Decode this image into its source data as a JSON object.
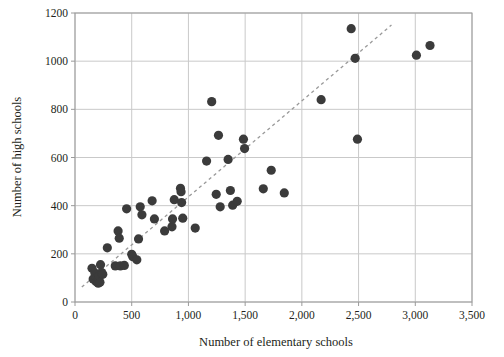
{
  "chart_data": {
    "type": "scatter",
    "title": "",
    "xlabel": "Number of elementary schools",
    "ylabel": "Number of high schools",
    "xlim": [
      0,
      3500
    ],
    "ylim": [
      0,
      1200
    ],
    "xticks": [
      0,
      500,
      1000,
      1500,
      2000,
      2500,
      3000,
      3500
    ],
    "xtick_labels": [
      "0",
      "500",
      "1,000",
      "1,500",
      "2,000",
      "2,500",
      "3,000",
      "3,500"
    ],
    "yticks": [
      0,
      200,
      400,
      600,
      800,
      1000,
      1200
    ],
    "ytick_labels": [
      "0",
      "200",
      "400",
      "600",
      "800",
      "1000",
      "1200"
    ],
    "grid": true,
    "legend": "none",
    "marker_color": "#3b3b3b",
    "marker_size": 4.6,
    "gridline_color": "#c9c9c9",
    "axis_color": "#9a9a9a",
    "points": [
      [
        150,
        140
      ],
      [
        160,
        95
      ],
      [
        175,
        120
      ],
      [
        185,
        85
      ],
      [
        195,
        100
      ],
      [
        200,
        88
      ],
      [
        205,
        78
      ],
      [
        210,
        92
      ],
      [
        215,
        108
      ],
      [
        220,
        82
      ],
      [
        225,
        155
      ],
      [
        235,
        122
      ],
      [
        245,
        115
      ],
      [
        285,
        225
      ],
      [
        355,
        150
      ],
      [
        380,
        295
      ],
      [
        390,
        265
      ],
      [
        400,
        150
      ],
      [
        435,
        152
      ],
      [
        455,
        387
      ],
      [
        500,
        198
      ],
      [
        510,
        188
      ],
      [
        545,
        175
      ],
      [
        560,
        262
      ],
      [
        575,
        395
      ],
      [
        590,
        362
      ],
      [
        680,
        420
      ],
      [
        700,
        345
      ],
      [
        790,
        295
      ],
      [
        855,
        312
      ],
      [
        860,
        345
      ],
      [
        875,
        425
      ],
      [
        930,
        472
      ],
      [
        935,
        458
      ],
      [
        940,
        413
      ],
      [
        950,
        348
      ],
      [
        1060,
        307
      ],
      [
        1160,
        585
      ],
      [
        1205,
        832
      ],
      [
        1245,
        447
      ],
      [
        1265,
        692
      ],
      [
        1280,
        395
      ],
      [
        1350,
        592
      ],
      [
        1370,
        463
      ],
      [
        1390,
        402
      ],
      [
        1430,
        418
      ],
      [
        1485,
        676
      ],
      [
        1495,
        637
      ],
      [
        1660,
        470
      ],
      [
        1730,
        547
      ],
      [
        1845,
        453
      ],
      [
        2170,
        840
      ],
      [
        2435,
        1135
      ],
      [
        2470,
        1012
      ],
      [
        2490,
        676
      ],
      [
        3010,
        1025
      ],
      [
        3130,
        1065
      ]
    ],
    "trendline": {
      "style": "dashed",
      "color": "#999999",
      "x_start": 60,
      "y_start": 62,
      "x_end": 2790,
      "y_end": 1150
    }
  }
}
